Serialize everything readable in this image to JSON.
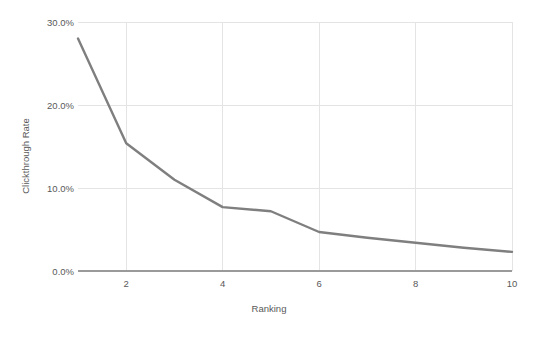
{
  "chart_data": {
    "type": "line",
    "title": "",
    "xlabel": "Ranking",
    "ylabel": "Clickthrough Rate",
    "x": [
      1,
      2,
      3,
      4,
      5,
      6,
      7,
      8,
      9,
      10
    ],
    "values": [
      28.0,
      15.4,
      11.0,
      7.7,
      7.2,
      4.7,
      4.0,
      3.4,
      2.8,
      2.3
    ],
    "series": [
      {
        "name": "Clickthrough Rate",
        "values": [
          28.0,
          15.4,
          11.0,
          7.7,
          7.2,
          4.7,
          4.0,
          3.4,
          2.8,
          2.3
        ]
      }
    ],
    "xlim": [
      1,
      10
    ],
    "ylim": [
      0,
      30
    ],
    "xticks": [
      2,
      4,
      6,
      8,
      10
    ],
    "xtick_labels": [
      "2",
      "4",
      "6",
      "8",
      "10"
    ],
    "yticks": [
      0,
      10,
      20,
      30
    ],
    "ytick_labels": [
      "0.0%",
      "10.0%",
      "20.0%",
      "30.0%"
    ],
    "grid": true,
    "legend": false,
    "legend_position": "none",
    "line_color": "#7f7f7f",
    "grid_color": "#e4e4e4",
    "axis_color": "#9a9a9a",
    "background_color": "#ffffff",
    "text_color": "#595959"
  }
}
